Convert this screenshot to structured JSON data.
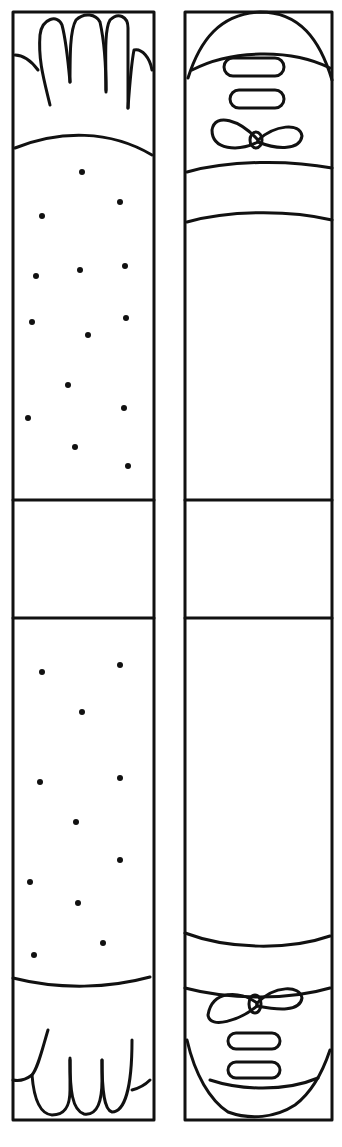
{
  "figure": {
    "type": "line-art craft template",
    "panels": [
      {
        "name": "arm-strip",
        "parts": [
          "hand-top",
          "sleeve-spotted-upper",
          "band-middle",
          "sleeve-spotted-lower",
          "hand-bottom"
        ]
      },
      {
        "name": "leg-strip",
        "parts": [
          "shoe-top",
          "band-top",
          "leg-plain-upper",
          "band-middle",
          "leg-plain-lower",
          "shoe-bottom"
        ]
      }
    ],
    "colors": {
      "ink": "#111111",
      "paper": "#ffffff"
    }
  }
}
